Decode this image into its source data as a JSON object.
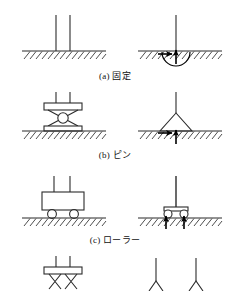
{
  "figure": {
    "kind": "structural-support-diagram",
    "language": "ja",
    "left_column_label": "support symbol",
    "right_column_label": "reaction forces",
    "stroke_color": "#2b2b2b",
    "fill_color": "#ffffff",
    "arrow_color": "#000000",
    "ground_hatch_color": "#3a3a3a"
  },
  "rows": [
    {
      "id": "fixed",
      "caption": "(a) 固定",
      "symbol": "two vertical members embedded in hatched ground",
      "reactions": [
        "horizontal",
        "vertical",
        "moment"
      ],
      "reaction_count": 3
    },
    {
      "id": "pin",
      "caption": "(b) ピン",
      "symbol": "pinned bearing with circle between plates on hatched ground",
      "reactions": [
        "horizontal",
        "vertical"
      ],
      "reaction_count": 2
    },
    {
      "id": "roller",
      "caption": "(c) ローラー",
      "symbol": "roller bearing with two wheels on hatched ground",
      "reactions": [
        "vertical",
        "vertical"
      ],
      "reaction_count": 1
    },
    {
      "id": "partial-bottom",
      "caption": "",
      "symbol": "bearing plate with crossed braces, cut off at image edge",
      "reactions": [],
      "reaction_count": 0
    }
  ]
}
